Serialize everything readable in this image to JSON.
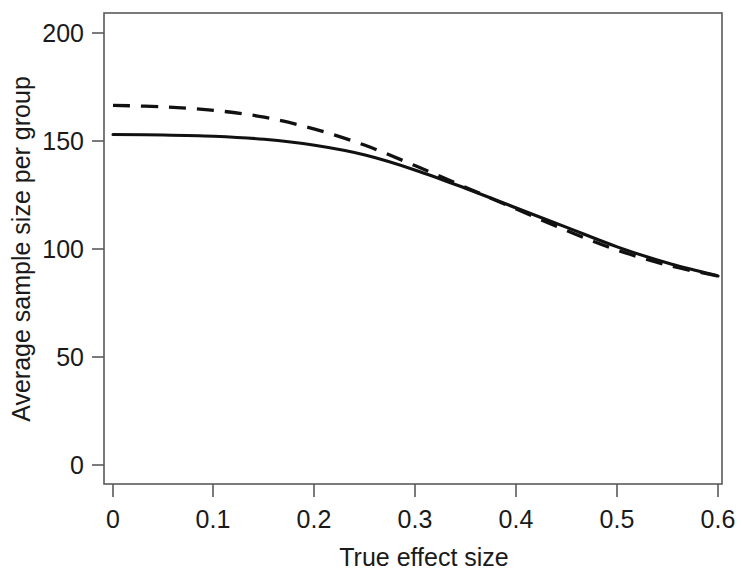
{
  "chart_data": {
    "type": "line",
    "title": "",
    "subtitle": "",
    "xlabel": "True effect size",
    "ylabel": "Average sample size per group",
    "xlim": [
      0,
      0.6
    ],
    "ylim": [
      0,
      200
    ],
    "xticks": [
      "0",
      "0.1",
      "0.2",
      "0.3",
      "0.4",
      "0.5",
      "0.6"
    ],
    "xtick_values": [
      0,
      0.1,
      0.2,
      0.3,
      0.4,
      0.5,
      0.6
    ],
    "yticks": [
      "0",
      "50",
      "100",
      "150",
      "200"
    ],
    "ytick_values": [
      0,
      50,
      100,
      150,
      200
    ],
    "grid": false,
    "legend": "none",
    "x": [
      0,
      0.05,
      0.1,
      0.15,
      0.2,
      0.25,
      0.3,
      0.35,
      0.4,
      0.45,
      0.5,
      0.55,
      0.6
    ],
    "series": [
      {
        "name": "solid-curve",
        "style": "solid",
        "color": "#111111",
        "values": [
          153,
          152.8,
          152.2,
          150.8,
          148,
          143.5,
          136.5,
          128,
          119,
          110,
          101,
          93.5,
          87.5
        ]
      },
      {
        "name": "dashed-curve",
        "style": "dashed",
        "color": "#111111",
        "values": [
          166.5,
          165.8,
          164.2,
          161,
          155.5,
          148,
          138.5,
          128.5,
          118.5,
          108.5,
          99.5,
          92.5,
          87.5
        ]
      }
    ],
    "annotations": []
  }
}
